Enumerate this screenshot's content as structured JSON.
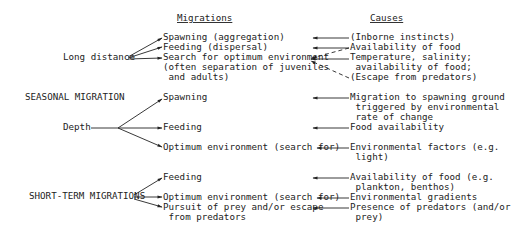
{
  "headers": {
    "migrations": "Migrations",
    "causes": "Causes"
  },
  "categories": {
    "long_distance": "Long distance",
    "seasonal_migration": "SEASONAL MIGRATION",
    "depth": "Depth",
    "short_term": "SHORT-TERM MIGRATIONS"
  },
  "long_distance": {
    "migrations": [
      "Spawning (aggregation)",
      "Feeding (dispersal)",
      "Search for optimum environment",
      "(often separation of juveniles",
      " and adults)"
    ],
    "causes": [
      "(Inborne instincts)",
      "Availability of food",
      "Temperature, salinity;",
      " availability of food;",
      "(Escape from predators)"
    ]
  },
  "depth": {
    "migrations": [
      "Spawning",
      "Feeding",
      "Optimum environment (search for)"
    ],
    "causes": [
      "Migration to spawning ground",
      " triggered by environmental",
      " rate of change",
      "Food availability",
      "Environmental factors (e.g.",
      " light)"
    ]
  },
  "short_term": {
    "migrations": [
      "Feeding",
      "Optimum environment (search for)",
      "Pursuit of prey and/or escape",
      " from predators"
    ],
    "causes": [
      "Availability of food (e.g.",
      " plankton, benthos)",
      "Environmental gradients",
      "Presence of predators (and/or",
      " prey)"
    ]
  }
}
